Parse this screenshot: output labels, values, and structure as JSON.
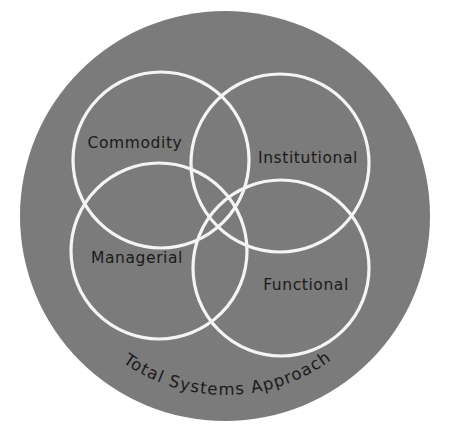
{
  "diagram": {
    "type": "venn",
    "background_color": "#ffffff",
    "outer_circle": {
      "label": "Total Systems Approach",
      "fill": "#7b7b7b",
      "cx": 225,
      "cy": 216,
      "r": 205
    },
    "ring_color": "#f4f4f4",
    "sets": [
      {
        "id": "commodity",
        "label": "Commodity",
        "cx": 161,
        "cy": 160,
        "r": 88,
        "label_x": 135,
        "label_y": 148
      },
      {
        "id": "institutional",
        "label": "Institutional",
        "cx": 280,
        "cy": 163,
        "r": 89,
        "label_x": 308,
        "label_y": 163
      },
      {
        "id": "managerial",
        "label": "Managerial",
        "cx": 159,
        "cy": 251,
        "r": 88,
        "label_x": 137,
        "label_y": 263
      },
      {
        "id": "functional",
        "label": "Functional",
        "cx": 281,
        "cy": 268,
        "r": 88,
        "label_x": 306,
        "label_y": 290
      }
    ]
  }
}
